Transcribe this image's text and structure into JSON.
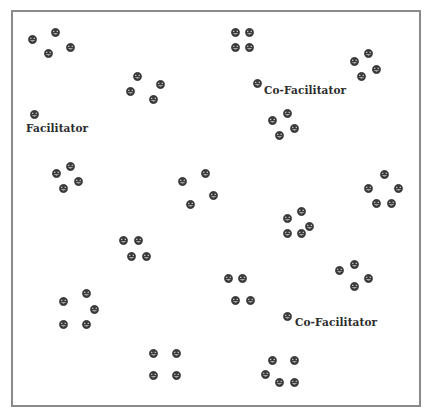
{
  "diagram": {
    "width": 428,
    "height": 415,
    "frame": {
      "left": 11,
      "top": 10,
      "right": 419,
      "bottom": 405,
      "border_color": "#8a8a8a"
    },
    "smiley_color": "#3a3a3a",
    "label_color": "#2b2b2b",
    "roles": [
      {
        "label": "Facilitator",
        "icon": {
          "x": 34,
          "y": 114
        },
        "text": {
          "x": 26,
          "y": 123
        }
      },
      {
        "label": "Co-Facilitator",
        "icon": {
          "x": 257,
          "y": 83
        },
        "text": {
          "x": 264,
          "y": 85
        }
      },
      {
        "label": "Co-Facilitator",
        "icon": {
          "x": 287,
          "y": 316
        },
        "text": {
          "x": 295,
          "y": 317
        }
      }
    ],
    "groups": [
      {
        "name": "group-1",
        "members": [
          [
            32,
            39
          ],
          [
            55,
            32
          ],
          [
            70,
            47
          ],
          [
            48,
            53
          ]
        ]
      },
      {
        "name": "group-2",
        "members": [
          [
            235,
            32
          ],
          [
            249,
            32
          ],
          [
            235,
            47
          ],
          [
            249,
            47
          ]
        ]
      },
      {
        "name": "group-3",
        "members": [
          [
            354,
            61
          ],
          [
            368,
            53
          ],
          [
            376,
            69
          ],
          [
            361,
            76
          ]
        ]
      },
      {
        "name": "group-4",
        "members": [
          [
            137,
            76
          ],
          [
            160,
            84
          ],
          [
            130,
            91
          ],
          [
            153,
            99
          ]
        ]
      },
      {
        "name": "group-5",
        "members": [
          [
            287,
            113
          ],
          [
            272,
            120
          ],
          [
            294,
            128
          ],
          [
            279,
            135
          ]
        ]
      },
      {
        "name": "group-6",
        "members": [
          [
            56,
            173
          ],
          [
            70,
            166
          ],
          [
            78,
            181
          ],
          [
            63,
            188
          ]
        ]
      },
      {
        "name": "group-7",
        "members": [
          [
            182,
            181
          ],
          [
            205,
            173
          ],
          [
            213,
            195
          ],
          [
            190,
            204
          ]
        ]
      },
      {
        "name": "group-8",
        "members": [
          [
            384,
            174
          ],
          [
            368,
            188
          ],
          [
            398,
            188
          ],
          [
            376,
            203
          ],
          [
            391,
            203
          ]
        ]
      },
      {
        "name": "group-9",
        "members": [
          [
            301,
            211
          ],
          [
            287,
            218
          ],
          [
            309,
            226
          ],
          [
            287,
            233
          ],
          [
            301,
            233
          ]
        ]
      },
      {
        "name": "group-10",
        "members": [
          [
            123,
            240
          ],
          [
            138,
            240
          ],
          [
            131,
            256
          ],
          [
            146,
            256
          ]
        ]
      },
      {
        "name": "group-11",
        "members": [
          [
            354,
            264
          ],
          [
            339,
            270
          ],
          [
            368,
            278
          ],
          [
            354,
            286
          ]
        ]
      },
      {
        "name": "group-12",
        "members": [
          [
            228,
            278
          ],
          [
            242,
            278
          ],
          [
            235,
            300
          ],
          [
            250,
            300
          ]
        ]
      },
      {
        "name": "group-13",
        "members": [
          [
            86,
            293
          ],
          [
            63,
            301
          ],
          [
            94,
            309
          ],
          [
            63,
            324
          ],
          [
            86,
            324
          ]
        ]
      },
      {
        "name": "group-14",
        "members": [
          [
            153,
            353
          ],
          [
            176,
            353
          ],
          [
            153,
            375
          ],
          [
            176,
            375
          ]
        ]
      },
      {
        "name": "group-15",
        "members": [
          [
            272,
            360
          ],
          [
            294,
            360
          ],
          [
            265,
            374
          ],
          [
            279,
            382
          ],
          [
            294,
            382
          ]
        ]
      }
    ]
  }
}
